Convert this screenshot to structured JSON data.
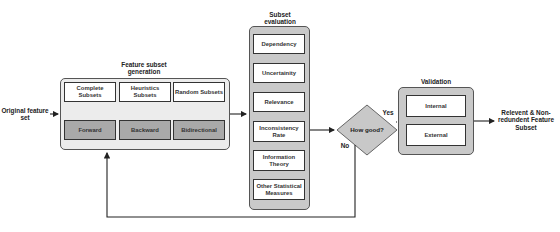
{
  "input_label": "Original feature set",
  "generation": {
    "title": "Feature subset generation",
    "strategies": [
      "Complete Subsets",
      "Heuristics Subsets",
      "Random Subsets"
    ],
    "directions": [
      "Forward",
      "Backward",
      "Bidirectional"
    ]
  },
  "evaluation": {
    "title": "Subset evaluation",
    "measures": [
      "Dependency",
      "Uncertainity",
      "Relevance",
      "Inconsistency Rate",
      "Information Theory",
      "Other Statistical Measures"
    ]
  },
  "decision": {
    "question": "How good?",
    "yes_label": "Yes",
    "no_label": "No"
  },
  "validation": {
    "title": "Validation",
    "items": [
      "Internal",
      "External"
    ]
  },
  "output_label": "Relevent & Non-redundent Feature Subset",
  "colors": {
    "container_light": "#ececec",
    "container_grey": "#c9c9c9",
    "box_dark": "#a9a9a9",
    "diamond": "#c8c8c8",
    "line": "#333333"
  }
}
